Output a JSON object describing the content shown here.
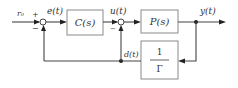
{
  "diagram": {
    "type": "feedback block diagram",
    "signals": {
      "reference": "r₀",
      "error": "e(t)",
      "control": "u(t)",
      "output": "y(t)",
      "disturbance": "d(t)"
    },
    "junction_signs": {
      "sum1_plus": "+",
      "sum1_minus": "−",
      "sum2_minus": "−"
    },
    "blocks": {
      "controller": "C(s)",
      "plant": "P(s)",
      "feedback_num": "1",
      "feedback_den": "Γ"
    },
    "colors": {
      "line": "#444444",
      "block_border": "#8a8a8a",
      "text": "#333333"
    }
  }
}
